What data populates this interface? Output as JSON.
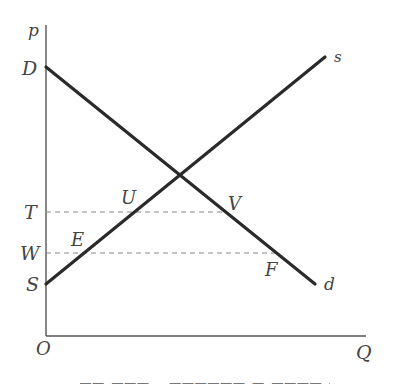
{
  "diagram": {
    "type": "supply-demand",
    "axes": {
      "y_label": "p",
      "x_label": "Q",
      "origin_label": "O"
    },
    "curves": {
      "demand": {
        "start_label": "D",
        "end_label": "d"
      },
      "supply": {
        "start_label": "S",
        "end_label": "s"
      }
    },
    "price_levels": [
      {
        "label": "T",
        "points": [
          "U",
          "V"
        ]
      },
      {
        "label": "W",
        "points": [
          "E",
          "F"
        ]
      }
    ],
    "points": {
      "U": "U",
      "V": "V",
      "E": "E",
      "F": "F"
    },
    "colors": {
      "curve": "#2a2a2a",
      "axis": "#555555",
      "dashed": "#888888",
      "label": "#444444"
    }
  }
}
